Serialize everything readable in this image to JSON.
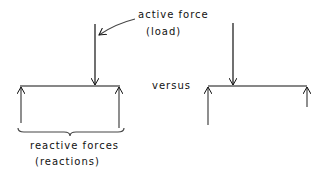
{
  "labels": {
    "active_force": "active force",
    "load": "(load)",
    "versus": "versus",
    "reactive_forces": "reactive forces",
    "reactions": "(reactions)"
  },
  "colors": {
    "ink": "#111111",
    "background": "#ffffff"
  }
}
